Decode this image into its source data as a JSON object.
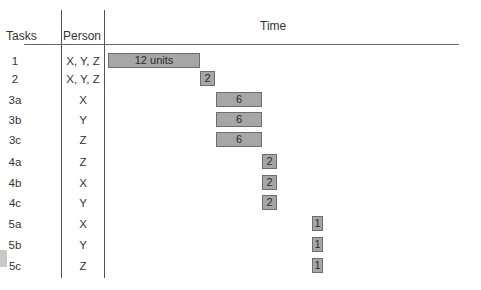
{
  "headers": {
    "tasks": "Tasks",
    "person": "Person",
    "time": "Time"
  },
  "rows": [
    {
      "task": "1",
      "person": "X, Y, Z",
      "label": "12 units",
      "start": 0,
      "duration": 12
    },
    {
      "task": "2",
      "person": "X, Y, Z",
      "label": "2",
      "start": 12,
      "duration": 2
    },
    {
      "task": "3a",
      "person": "X",
      "label": "6",
      "start": 14,
      "duration": 6
    },
    {
      "task": "3b",
      "person": "Y",
      "label": "6",
      "start": 14,
      "duration": 6
    },
    {
      "task": "3c",
      "person": "Z",
      "label": "6",
      "start": 14,
      "duration": 6
    },
    {
      "task": "4a",
      "person": "Z",
      "label": "2",
      "start": 20,
      "duration": 2
    },
    {
      "task": "4b",
      "person": "X",
      "label": "2",
      "start": 20,
      "duration": 2
    },
    {
      "task": "4c",
      "person": "Y",
      "label": "2",
      "start": 20,
      "duration": 2
    },
    {
      "task": "5a",
      "person": "X",
      "label": "1",
      "start": 23,
      "duration": 1
    },
    {
      "task": "5b",
      "person": "Y",
      "label": "1",
      "start": 23,
      "duration": 1
    },
    {
      "task": "5c",
      "person": "Z",
      "label": "1",
      "start": 23,
      "duration": 1
    }
  ],
  "colors": {
    "bar_fill": "#a6a6a6",
    "bar_border": "#6e6e6e",
    "lines": "#555555"
  }
}
